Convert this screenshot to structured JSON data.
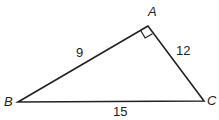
{
  "diagram": {
    "type": "right-triangle",
    "vertices": [
      {
        "name": "A",
        "x": 148,
        "y": 26,
        "label_x": 148,
        "label_y": 16
      },
      {
        "name": "B",
        "x": 18,
        "y": 102,
        "label_x": 4,
        "label_y": 106
      },
      {
        "name": "C",
        "x": 204,
        "y": 101,
        "label_x": 207,
        "label_y": 105
      }
    ],
    "sides": [
      {
        "from": "A",
        "to": "B",
        "length": "9",
        "label_x": 80,
        "label_y": 57
      },
      {
        "from": "A",
        "to": "C",
        "length": "12",
        "label_x": 176,
        "label_y": 55
      },
      {
        "from": "B",
        "to": "C",
        "length": "15",
        "label_x": 113,
        "label_y": 116
      }
    ],
    "right_angle_at": "A",
    "line_color": "#222222"
  }
}
